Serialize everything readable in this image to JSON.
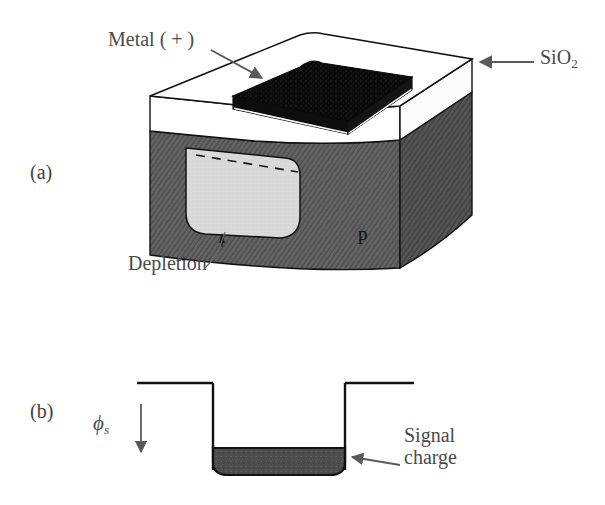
{
  "figure": {
    "panels": [
      {
        "id": "a",
        "label": "(a)"
      },
      {
        "id": "b",
        "label": "(b)"
      }
    ]
  },
  "panel_a": {
    "label": "(a)",
    "labels": {
      "metal": "Metal ( + )",
      "oxide": "SiO",
      "oxide_subscript": "2",
      "depletion": "Depletion",
      "substrate": "p"
    },
    "annotations": [
      {
        "name": "metal-arrow",
        "text": "Metal ( + )",
        "points_to": "black metal gate plate"
      },
      {
        "name": "oxide-arrow",
        "text": "SiO2",
        "points_to": "white oxide layer right edge"
      },
      {
        "name": "depletion-arrow",
        "text": "Depletion",
        "points_to": "light gray depletion region"
      }
    ],
    "colors": {
      "metal": "#0a0a0a",
      "oxide": "#ffffff",
      "substrate": "#5a5a5a",
      "depletion": "#d9d9d9",
      "outline": "#111111"
    }
  },
  "panel_b": {
    "label": "(b)",
    "labels": {
      "potential_symbol": "ϕ",
      "potential_subscript": "s",
      "signal_line1": "Signal",
      "signal_line2": "charge"
    },
    "annotations": [
      {
        "name": "phi-axis-arrow",
        "text": "ϕs",
        "direction": "down"
      },
      {
        "name": "signal-charge-arrow",
        "text": "Signal charge",
        "points_to": "dark charge packet in well"
      }
    ],
    "colors": {
      "charge": "#4d4d4d",
      "well_outline": "#111111",
      "arrow": "#555555"
    }
  }
}
